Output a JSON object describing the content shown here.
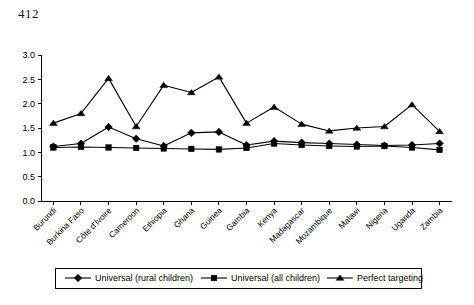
{
  "page": {
    "number": "412"
  },
  "chart_data": {
    "type": "line",
    "title": "",
    "subtitle": "",
    "xlabel": "",
    "ylabel": "",
    "ylim": [
      0.0,
      3.0
    ],
    "ytick_labels": [
      "0.0",
      "0.5",
      "1.0",
      "1.5",
      "2.0",
      "2.5",
      "3.0"
    ],
    "ytick_values": [
      0.0,
      0.5,
      1.0,
      1.5,
      2.0,
      2.5,
      3.0
    ],
    "grid": false,
    "legend_position": "bottom",
    "categories": [
      "Burundi",
      "Burkina Faso",
      "Côte d'Ivoire",
      "Cameroon",
      "Ethiopia",
      "Ghana",
      "Guinea",
      "Gambia",
      "Kenya",
      "Madagascar",
      "Mozambique",
      "Malawi",
      "Nigeria",
      "Uganda",
      "Zambia"
    ],
    "series": [
      {
        "name": "Universal (rural children)",
        "marker": "diamond",
        "values": [
          1.12,
          1.18,
          1.52,
          1.28,
          1.13,
          1.4,
          1.42,
          1.15,
          1.23,
          1.2,
          1.18,
          1.16,
          1.14,
          1.15,
          1.18
        ]
      },
      {
        "name": "Universal (all children)",
        "marker": "square",
        "values": [
          1.1,
          1.11,
          1.1,
          1.09,
          1.08,
          1.07,
          1.06,
          1.09,
          1.18,
          1.15,
          1.13,
          1.12,
          1.13,
          1.1,
          1.05
        ]
      },
      {
        "name": "Perfect targeting",
        "marker": "triangle",
        "values": [
          1.6,
          1.8,
          2.52,
          1.53,
          2.38,
          2.23,
          2.55,
          1.6,
          1.93,
          1.58,
          1.44,
          1.5,
          1.53,
          1.98,
          1.43
        ]
      }
    ]
  },
  "legend": {
    "items": [
      {
        "label": "Universal (rural children)",
        "marker": "diamond"
      },
      {
        "label": "Universal (all children)",
        "marker": "square"
      },
      {
        "label": "Perfect targeting",
        "marker": "triangle"
      }
    ]
  }
}
